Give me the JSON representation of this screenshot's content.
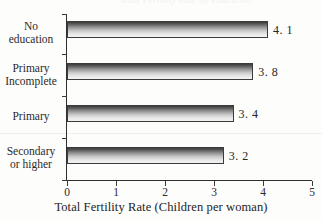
{
  "artifacts": {
    "top_clipped_text": "Total Fertility Rate by Education"
  },
  "chart_data": {
    "type": "bar",
    "orientation": "horizontal",
    "title": "",
    "xlabel": "Total Fertility Rate (Children per woman)",
    "ylabel": "",
    "categories": [
      "No education",
      "Primary Incomplete",
      "Primary",
      "Secondary or higher"
    ],
    "category_lines": [
      [
        "No",
        "education"
      ],
      [
        "Primary",
        "Incomplete"
      ],
      [
        "Primary",
        ""
      ],
      [
        "Secondary",
        "or higher"
      ]
    ],
    "values": [
      4.1,
      3.8,
      3.4,
      3.2
    ],
    "value_labels": [
      "4. 1",
      "3. 8",
      "3. 4",
      "3. 2"
    ],
    "xlim": [
      0,
      5
    ],
    "xticks": [
      0,
      1,
      2,
      3,
      4,
      5
    ],
    "xtick_labels": [
      "0",
      "1",
      "2",
      "3",
      "4",
      "5"
    ],
    "grid": false,
    "legend": false,
    "bar_style": {
      "fill": "vertical-gradient-dark-to-light",
      "gradient_top": "#3c3c3c",
      "gradient_bottom": "#f2f2f2",
      "outline": "#3b3b3b"
    },
    "background": "#fdfdfc",
    "axis_color": "#2f2f2f"
  }
}
